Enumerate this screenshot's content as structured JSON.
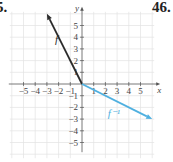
{
  "problem_labels": {
    "left": "5.",
    "right": "46."
  },
  "chart_data": {
    "type": "line",
    "title": "",
    "xlabel": "x",
    "ylabel": "y",
    "xlim": [
      -6,
      6
    ],
    "ylim": [
      -6,
      6
    ],
    "grid": true,
    "x_ticks": [
      -5,
      -4,
      -3,
      -2,
      -1,
      1,
      2,
      3,
      4,
      5
    ],
    "y_ticks": [
      -5,
      -4,
      -3,
      -2,
      -1,
      1,
      2,
      3,
      4,
      5
    ],
    "x_tick_labels": [
      "−5",
      "−4",
      "−3",
      "−2",
      "−1",
      "1",
      "2",
      "3",
      "4",
      "5"
    ],
    "y_tick_labels": [
      "5",
      "4",
      "3",
      "2",
      "1",
      "−1",
      "−2",
      "−3",
      "−4",
      "−5"
    ],
    "series": [
      {
        "name": "f",
        "color": "#2b2b2b",
        "points": [
          [
            0,
            0
          ],
          [
            -3,
            6
          ]
        ],
        "arrow": "end"
      },
      {
        "name": "f⁻¹",
        "color": "#4fb0e0",
        "points": [
          [
            0,
            0
          ],
          [
            6,
            -3
          ]
        ],
        "arrow": "end"
      }
    ],
    "annotations": [
      {
        "text": "f",
        "x": -2.3,
        "y": 3.5
      },
      {
        "text": "f⁻¹",
        "x": 2.2,
        "y": -2.8
      }
    ]
  }
}
